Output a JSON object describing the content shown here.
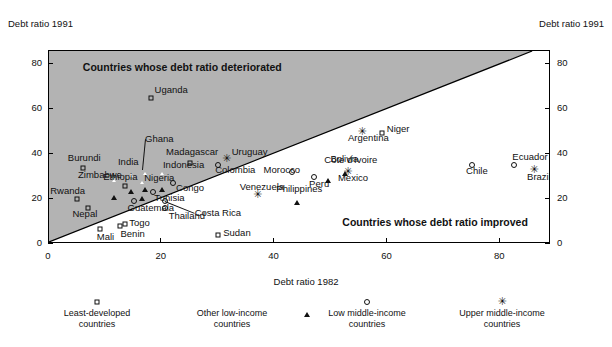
{
  "chart_data": {
    "type": "scatter",
    "title": "",
    "xlabel": "Debt ratio 1982",
    "ylabel": "Debt ratio 1991",
    "ylabel_right": "Debt ratio 1991",
    "xlim": [
      0,
      89
    ],
    "ylim": [
      0,
      86
    ],
    "xticks": [
      0,
      20,
      40,
      60,
      80
    ],
    "yticks": [
      0,
      20,
      40,
      60,
      80
    ],
    "grid": false,
    "annotations": [
      {
        "text": "Countries whose debt ratio deteriorated",
        "x": 6,
        "y": 79
      },
      {
        "text": "Countries whose debt ratio improved",
        "x": 52,
        "y": 10
      }
    ],
    "reference_line": {
      "type": "identity",
      "from": [
        0,
        0
      ],
      "to": [
        86,
        86
      ],
      "note": "y = x; region above line shaded grey"
    },
    "shaded_region": {
      "fill": "#b3b3b3",
      "description": "area above the 45-degree line"
    },
    "legend": {
      "position": "below-axis",
      "entries": [
        {
          "marker": "square",
          "label_line1": "Least-developed",
          "label_line2": "countries"
        },
        {
          "marker": "triangle",
          "label_line1": "Other low-income",
          "label_line2": "countries"
        },
        {
          "marker": "circle",
          "label_line1": "Low middle-income",
          "label_line2": "countries"
        },
        {
          "marker": "star",
          "label_line1": "Upper middle-income",
          "label_line2": "countries"
        }
      ]
    },
    "points": [
      {
        "name": "Uganda",
        "x": 18,
        "y": 65,
        "marker": "square",
        "lx": 4,
        "ly": -8
      },
      {
        "name": "Ghana",
        "x": 16.5,
        "y": 33,
        "marker": "triangle",
        "lx": 3,
        "ly": -31,
        "leader": true
      },
      {
        "name": "Madagascar",
        "x": 25,
        "y": 36,
        "marker": "square",
        "lx": -24,
        "ly": -11
      },
      {
        "name": "Indonesia",
        "x": 19.5,
        "y": 33,
        "marker": "triangle",
        "lx": 4,
        "ly": -5
      },
      {
        "name": "Uruguay",
        "x": 31.5,
        "y": 38,
        "marker": "star",
        "lx": 5,
        "ly": -7
      },
      {
        "name": "Colombia",
        "x": 30,
        "y": 35,
        "marker": "circle",
        "lx": -3,
        "ly": 5
      },
      {
        "name": "Argentina",
        "x": 55.5,
        "y": 50,
        "marker": "star",
        "lx": -14,
        "ly": 6
      },
      {
        "name": "Niger",
        "x": 59,
        "y": 49.5,
        "marker": "square",
        "lx": 5,
        "ly": -4
      },
      {
        "name": "Burundi",
        "x": 6,
        "y": 34,
        "marker": "square",
        "lx": -15,
        "ly": -10
      },
      {
        "name": "India",
        "x": 14,
        "y": 32,
        "marker": "triangle",
        "lx": -10,
        "ly": -10
      },
      {
        "name": "Côte d'Ivoire",
        "x": 52,
        "y": 40,
        "marker": "triangle",
        "lx": -18,
        "ly": 6
      },
      {
        "name": "Bolivia",
        "x": 49,
        "y": 37,
        "marker": "triangle",
        "lx": 5,
        "ly": -2
      },
      {
        "name": "Ecuador",
        "x": 82.5,
        "y": 35,
        "marker": "circle",
        "lx": -2,
        "ly": -8
      },
      {
        "name": "Zimbabwe",
        "x": 11,
        "y": 29.5,
        "marker": "triangle",
        "lx": -33,
        "ly": -3
      },
      {
        "name": "Nigeria",
        "x": 16,
        "y": 29,
        "marker": "triangle",
        "lx": 5,
        "ly": -1
      },
      {
        "name": "Morocco",
        "x": 43,
        "y": 32,
        "marker": "circle",
        "lx": -28,
        "ly": -2
      },
      {
        "name": "Mexico",
        "x": 53,
        "y": 32,
        "marker": "star",
        "lx": -10,
        "ly": 6
      },
      {
        "name": "Chile",
        "x": 75,
        "y": 35,
        "marker": "circle",
        "lx": -6,
        "ly": 6
      },
      {
        "name": "Brazil",
        "x": 86,
        "y": 33,
        "marker": "star",
        "lx": -7,
        "ly": 7
      },
      {
        "name": "Ethiopia",
        "x": 13.5,
        "y": 26,
        "marker": "square",
        "lx": -22,
        "ly": -9
      },
      {
        "name": "Congo",
        "x": 22,
        "y": 27,
        "marker": "circle",
        "lx": 3,
        "ly": 5
      },
      {
        "name": "Peru",
        "x": 47,
        "y": 30,
        "marker": "circle",
        "lx": -5,
        "ly": 7
      },
      {
        "name": "Philippines",
        "x": 43.5,
        "y": 27,
        "marker": "triangle",
        "lx": -18,
        "ly": 6
      },
      {
        "name": "Rwanda",
        "x": 5,
        "y": 20,
        "marker": "square",
        "lx": -27,
        "ly": -8
      },
      {
        "name": "Venezuela",
        "x": 37,
        "y": 22,
        "marker": "star",
        "lx": -18,
        "ly": -8
      },
      {
        "name": "Tunisia",
        "x": 18.5,
        "y": 23,
        "marker": "circle",
        "lx": 1,
        "ly": 6
      },
      {
        "name": "Nepal",
        "x": 7,
        "y": 16,
        "marker": "square",
        "lx": -16,
        "ly": 6
      },
      {
        "name": "Guatemala",
        "x": 15,
        "y": 19,
        "marker": "circle",
        "lx": -6,
        "ly": 7
      },
      {
        "name": "Costa Rica",
        "x": 20.5,
        "y": 19,
        "marker": "circle",
        "lx": 30,
        "ly": 12,
        "leader": true
      },
      {
        "name": "Thailand",
        "x": 20.5,
        "y": 16,
        "marker": "circle",
        "lx": 4,
        "ly": 8
      },
      {
        "name": "Togo",
        "x": 13.5,
        "y": 9,
        "marker": "square",
        "lx": 4,
        "ly": -1
      },
      {
        "name": "Benin",
        "x": 12.5,
        "y": 8,
        "marker": "square",
        "lx": 1,
        "ly": 8
      },
      {
        "name": "Mali",
        "x": 9,
        "y": 6.5,
        "marker": "square",
        "lx": -3,
        "ly": 8
      },
      {
        "name": "Sudan",
        "x": 30,
        "y": 4,
        "marker": "square",
        "lx": 5,
        "ly": -2
      }
    ]
  },
  "accent_colors": {
    "shade_fill": "#b3b3b3",
    "axis": "#000000",
    "text": "#111111"
  }
}
